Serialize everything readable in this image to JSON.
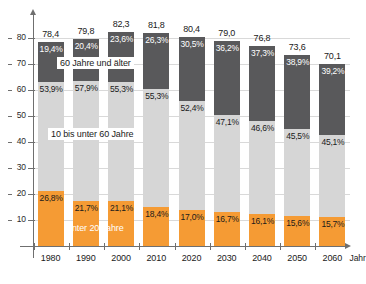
{
  "chart_data": {
    "type": "bar",
    "stacked": true,
    "title": "",
    "subtitle": "",
    "xlabel": "Jahr",
    "ylabel": "",
    "categories": [
      "1980",
      "1990",
      "2000",
      "2010",
      "2020",
      "2030",
      "2040",
      "2050",
      "2060"
    ],
    "ylim": [
      0,
      85
    ],
    "yticks": [
      10,
      20,
      30,
      40,
      50,
      60,
      70,
      80
    ],
    "ytick_labels": [
      "10",
      "20",
      "30",
      "40",
      "50",
      "60",
      "70",
      "80"
    ],
    "grid": true,
    "legend_position": "inline-callouts",
    "totals": [
      "78,4",
      "79,8",
      "82,3",
      "81,8",
      "80,4",
      "79,0",
      "76,8",
      "73,6",
      "70,1"
    ],
    "totals_values": [
      78.4,
      79.8,
      82.3,
      81.8,
      80.4,
      79.0,
      76.8,
      73.6,
      70.1
    ],
    "series": [
      {
        "name": "unter 20 Jahre",
        "color": "#f59b34",
        "percent_labels": [
          "26,8%",
          "21,7%",
          "21,1%",
          "18,4%",
          "17,0%",
          "16,7%",
          "16,1%",
          "15,6%",
          "15,7%"
        ],
        "percents": [
          26.8,
          21.7,
          21.1,
          18.4,
          17.0,
          16.7,
          16.1,
          15.6,
          15.7
        ],
        "values": [
          21.0,
          17.3,
          17.4,
          15.1,
          13.7,
          13.2,
          12.4,
          11.5,
          11.0
        ]
      },
      {
        "name": "10 bis unter 60 Jahre",
        "color": "#d6d6d6",
        "percent_labels": [
          "53,9%",
          "57,9%",
          "55,3%",
          "55,3%",
          "52,4%",
          "47,1%",
          "46,6%",
          "45,5%",
          "45,1%"
        ],
        "percents": [
          53.9,
          57.9,
          55.3,
          55.3,
          52.4,
          47.1,
          46.6,
          45.5,
          45.1
        ],
        "values": [
          42.2,
          46.2,
          45.5,
          45.2,
          42.1,
          37.2,
          35.8,
          33.5,
          31.6
        ]
      },
      {
        "name": "60 Jahre und älter",
        "color": "#59595b",
        "percent_labels": [
          "19,4%",
          "20,4%",
          "23,6%",
          "26,3%",
          "30,5%",
          "36,2%",
          "37,3%",
          "38,9%",
          "39,2%"
        ],
        "percents": [
          19.4,
          20.4,
          23.6,
          26.3,
          30.5,
          36.2,
          37.3,
          38.9,
          39.2
        ],
        "values": [
          15.2,
          16.3,
          19.4,
          21.5,
          24.5,
          28.6,
          28.6,
          28.6,
          27.5
        ]
      }
    ],
    "callouts": [
      {
        "name": "60 Jahre und älter",
        "text": "60 Jahre und älter"
      },
      {
        "name": "10 bis unter 60 Jahre",
        "text": "10 bis unter 60 Jahre"
      },
      {
        "name": "unter 20 Jahre",
        "text": "unter 20 Jahre"
      }
    ]
  },
  "colors": {
    "young": "#f59b34",
    "middle": "#d6d6d6",
    "old": "#59595b",
    "axis": "#6f6f6f",
    "grid": "#d9d9d9",
    "text": "#1a1a1a"
  }
}
